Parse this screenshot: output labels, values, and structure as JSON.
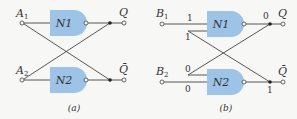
{
  "colors": {
    "gate_fill": "#9dc3e6",
    "wire": "#444444",
    "background": "#f7f7f5"
  },
  "panel_a": {
    "caption": "(a)",
    "inputs": [
      {
        "label": "A",
        "sub": "1"
      },
      {
        "label": "A",
        "sub": "2"
      }
    ],
    "gates": [
      "N1",
      "N2"
    ],
    "outputs": [
      "Q",
      "Q̄"
    ]
  },
  "panel_b": {
    "caption": "(b)",
    "inputs": [
      {
        "label": "B",
        "sub": "1"
      },
      {
        "label": "B",
        "sub": "2"
      }
    ],
    "gates": [
      "N1",
      "N2"
    ],
    "outputs": [
      "Q",
      "Q̄"
    ],
    "logic_values": {
      "n1_in_top": "1",
      "n1_in_bottom": "1",
      "n1_out": "0",
      "n2_in_top": "0",
      "n2_in_bottom": "0",
      "n2_out": "1"
    }
  }
}
